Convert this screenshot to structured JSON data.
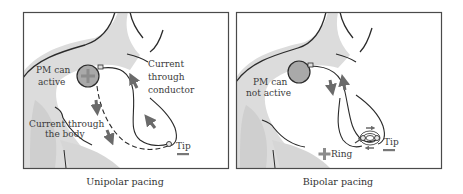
{
  "figure": {
    "panels": [
      {
        "id": "unipolar",
        "caption": "Unipolar pacing",
        "labels": {
          "pm_status_line1": "PM can",
          "pm_status_line2": "active",
          "conductor_line1": "Current",
          "conductor_line2": "through",
          "conductor_line3": "conductor",
          "body_line1": "Current through",
          "body_line2": "the body",
          "tip": "Tip"
        },
        "pacemaker_symbol": "+",
        "tip_symbol": "−"
      },
      {
        "id": "bipolar",
        "caption": "Bipolar pacing",
        "labels": {
          "pm_status_line1": "PM can",
          "pm_status_line2": "not active",
          "ring": "Ring",
          "tip": "Tip"
        },
        "ring_symbol": "+",
        "tip_symbol": "−"
      }
    ],
    "colors": {
      "outline": "#2b2b2b",
      "body_shade": "#d9d9d9",
      "pacemaker_fill": "#a8a8a8",
      "plus_sign": "#8c8c8c",
      "arrow_fill": "#707070",
      "frame": "#4a4a4a"
    }
  }
}
